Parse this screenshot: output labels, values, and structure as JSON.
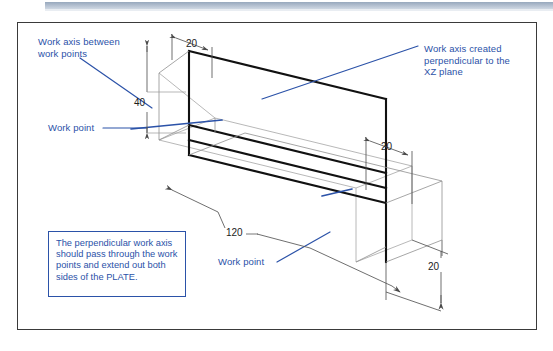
{
  "document": {
    "type": "isometric-technical-drawing",
    "subject": "PLATE with work points and work axes"
  },
  "annotations": {
    "work_axis_between": "Work axis between\nwork points",
    "work_axis_perpendicular": "Work axis created\nperpendicular to the\nXZ plane",
    "work_point_left": "Work point",
    "work_point_right": "Work point"
  },
  "note": {
    "text": "The perpendicular work axis should pass through the work points and extend out both sides of the PLATE."
  },
  "dimensions": {
    "top_20": "20",
    "left_40": "40",
    "bottom_120": "120",
    "mid_right_20": "20",
    "far_right_20": "20"
  },
  "colors": {
    "annotation_blue": "#2b52a8",
    "axis_blue": "#2b52a8",
    "object_line": "#111111",
    "dim_line": "#555555",
    "hidden_line": "#9a9a9a",
    "frame": "#3a3a3a",
    "titlebar": "#97a8bd"
  }
}
